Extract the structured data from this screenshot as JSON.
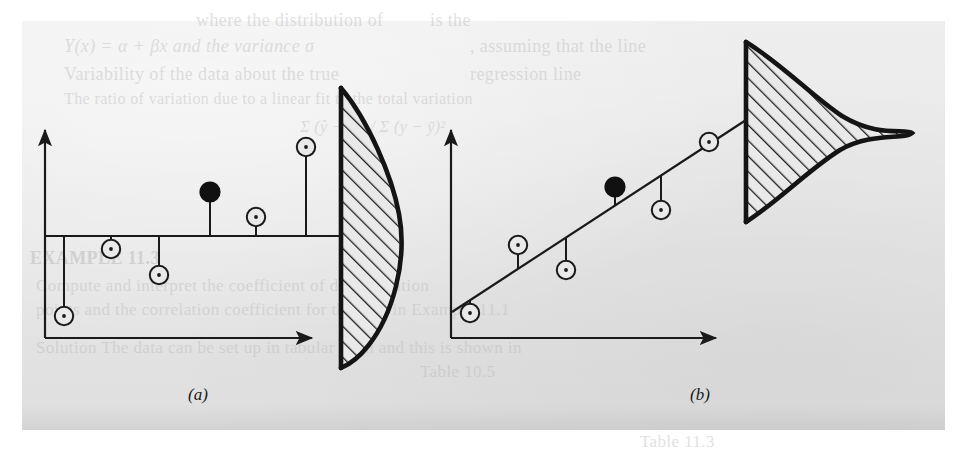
{
  "page": {
    "kind": "scanned-book-page",
    "background_color": "#ffffff",
    "paper_color": "#e7e7e7",
    "ink_color": "#1a1a1a",
    "ghost_text_color": "#b9b9b9"
  },
  "figure": {
    "caption_a": "(a)",
    "caption_b": "(b)",
    "panels": [
      {
        "id": "a",
        "label": "(a)",
        "description": "Scatter about a horizontal fitted line with a wide residual distribution",
        "fit_line": "horizontal",
        "distribution": "wide-flat-normal"
      },
      {
        "id": "b",
        "label": "(b)",
        "description": "Scatter about a sloped fitted line with a narrow residual distribution",
        "fit_line": "positive-slope",
        "distribution": "narrow-peaked-normal"
      }
    ]
  },
  "ghost_text": [
    {
      "text": "where the distribution of",
      "x": 196,
      "y": 10,
      "size": 18,
      "style": "normal"
    },
    {
      "text": "is the",
      "x": 430,
      "y": 10,
      "size": 18,
      "style": "normal"
    },
    {
      "text": "Y(x) = α + βx and the variance σ",
      "x": 64,
      "y": 36,
      "size": 18,
      "style": "italic"
    },
    {
      "text": ", assuming that the line",
      "x": 470,
      "y": 36,
      "size": 18,
      "style": "normal"
    },
    {
      "text": "Variability of the data about the true",
      "x": 64,
      "y": 64,
      "size": 18,
      "style": "normal"
    },
    {
      "text": "regression line",
      "x": 470,
      "y": 64,
      "size": 18,
      "style": "normal"
    },
    {
      "text": "The ratio of variation due to a linear fit to the total variation",
      "x": 64,
      "y": 90,
      "size": 16,
      "style": "normal"
    },
    {
      "text": "Σ (ŷ − ȳ)² / Σ (y − ȳ)²",
      "x": 300,
      "y": 118,
      "size": 16,
      "style": "italic"
    },
    {
      "text": "EXAMPLE 11.3",
      "x": 30,
      "y": 248,
      "size": 18,
      "style": "bold"
    },
    {
      "text": "Compute and interpret the coefficient of determination",
      "x": 36,
      "y": 276,
      "size": 17,
      "style": "normal"
    },
    {
      "text": "points and the correlation coefficient for the data in Example 11.1",
      "x": 36,
      "y": 300,
      "size": 17,
      "style": "normal"
    },
    {
      "text": "Solution    The data can be set up in tabular form and this is shown in",
      "x": 36,
      "y": 338,
      "size": 17,
      "style": "normal"
    },
    {
      "text": "Table 10.5",
      "x": 420,
      "y": 362,
      "size": 17,
      "style": "normal"
    },
    {
      "text": "Table 11.3",
      "x": 640,
      "y": 432,
      "size": 17,
      "style": "normal"
    }
  ],
  "chart_data": [
    {
      "type": "scatter",
      "panel": "a",
      "title": "(a)",
      "xlabel": "",
      "ylabel": "",
      "grid": false,
      "legend": null,
      "axes": {
        "x_axis_y": 338,
        "y_axis_x": 45,
        "x_arrow_tip": 318,
        "y_arrow_tip": 126
      },
      "fit_line": {
        "kind": "horizontal",
        "y": 236,
        "x_start": 45,
        "x_end": 341
      },
      "xlim": [
        45,
        341
      ],
      "points": [
        {
          "x": 64,
          "y": 316,
          "filled": false,
          "residual_to": 236
        },
        {
          "x": 111,
          "y": 249,
          "filled": false,
          "residual_to": 236
        },
        {
          "x": 159,
          "y": 275,
          "filled": false,
          "residual_to": 236
        },
        {
          "x": 210,
          "y": 192,
          "filled": true,
          "residual_to": 236
        },
        {
          "x": 256,
          "y": 217,
          "filled": false,
          "residual_to": 236
        },
        {
          "x": 306,
          "y": 147,
          "filled": false,
          "residual_to": 236
        }
      ],
      "distribution": {
        "orientation": "vertical",
        "baseline_x": 341,
        "mean_y": 236,
        "top_y": 88,
        "bottom_y": 368,
        "peak_x": 424,
        "spread": "wide",
        "hatched": true,
        "hatch_angle_deg": 45
      }
    },
    {
      "type": "scatter",
      "panel": "b",
      "title": "(b)",
      "xlabel": "",
      "ylabel": "",
      "grid": false,
      "legend": null,
      "axes": {
        "x_axis_y": 338,
        "y_axis_x": 451,
        "x_arrow_tip": 722,
        "y_arrow_tip": 126
      },
      "fit_line": {
        "kind": "sloped",
        "x_start": 452,
        "y_start": 312,
        "x_end": 746,
        "y_end": 120
      },
      "xlim": [
        451,
        746
      ],
      "points": [
        {
          "x": 470,
          "y": 313,
          "filled": false,
          "residual_to": 300
        },
        {
          "x": 518,
          "y": 245,
          "filled": false,
          "residual_to": 268
        },
        {
          "x": 566,
          "y": 270,
          "filled": false,
          "residual_to": 237
        },
        {
          "x": 615,
          "y": 187,
          "filled": true,
          "residual_to": 205
        },
        {
          "x": 661,
          "y": 210,
          "filled": false,
          "residual_to": 175
        },
        {
          "x": 709,
          "y": 142,
          "filled": false,
          "residual_to": 144
        }
      ],
      "distribution": {
        "orientation": "vertical",
        "baseline_x": 746,
        "mean_y": 132,
        "top_y": 42,
        "bottom_y": 222,
        "peak_x": 912,
        "spread": "narrow",
        "hatched": true,
        "hatch_angle_deg": 45
      }
    }
  ]
}
